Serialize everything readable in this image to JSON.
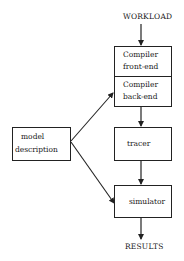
{
  "diagram": {
    "input_label": "WORKLOAD",
    "output_label": "RESULTS",
    "nodes": {
      "compiler_front_end": {
        "line1": "Compiler",
        "line2": "front-end"
      },
      "compiler_back_end": {
        "line1": "Compiler",
        "line2": "back-end"
      },
      "tracer": {
        "label": "tracer"
      },
      "simulator": {
        "label": "simulator"
      },
      "model_description": {
        "line1": "model",
        "line2": "description"
      }
    },
    "edges": [
      {
        "from": "WORKLOAD",
        "to": "compiler_front_end"
      },
      {
        "from": "compiler_back_end",
        "to": "tracer"
      },
      {
        "from": "tracer",
        "to": "simulator"
      },
      {
        "from": "simulator",
        "to": "RESULTS"
      },
      {
        "from": "model_description",
        "to": "compiler_back_end"
      },
      {
        "from": "model_description",
        "to": "simulator"
      }
    ]
  }
}
